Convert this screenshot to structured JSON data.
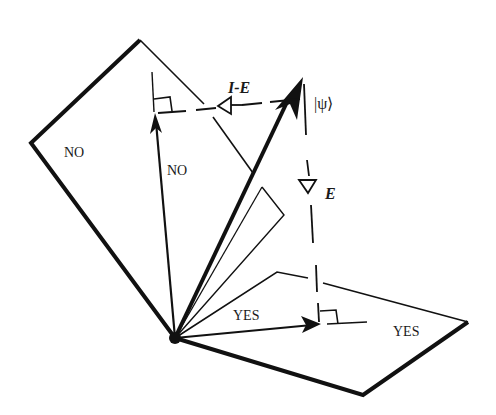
{
  "diagram": {
    "title": "",
    "labels": {
      "no_plane": "NO",
      "no_vector": "NO",
      "yes_vector": "YES",
      "yes_plane": "YES",
      "psi_ket": "|ψ⟩",
      "projector_complement": "I-E",
      "projector": "E"
    },
    "colors": {
      "ink": "#111111",
      "background": "#ffffff"
    },
    "elements": [
      {
        "name": "no-plane",
        "type": "parallelogram",
        "label": "NO"
      },
      {
        "name": "yes-plane",
        "type": "parallelogram",
        "label": "YES"
      },
      {
        "name": "psi-vector",
        "type": "arrow",
        "label": "|ψ⟩"
      },
      {
        "name": "no-projection-vector",
        "type": "arrow",
        "label": "NO"
      },
      {
        "name": "yes-projection-vector",
        "type": "arrow",
        "label": "YES"
      },
      {
        "name": "i-minus-e-projection",
        "type": "dashed-arrow",
        "label": "I-E"
      },
      {
        "name": "e-projection",
        "type": "dashed-arrow",
        "label": "E"
      }
    ]
  }
}
